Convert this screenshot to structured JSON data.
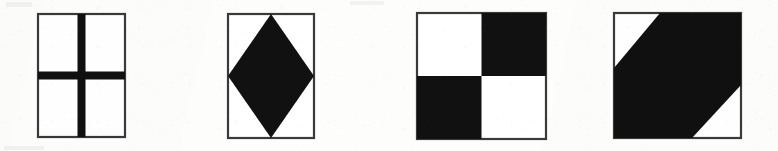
{
  "page": {
    "kind": "scanned-figure-strip",
    "background_color": "#fdfdfc",
    "ink_color": "#111111",
    "outline_color": "#3a3a3a",
    "width": 778,
    "height": 151,
    "caption": ""
  },
  "figures": [
    {
      "index": 1,
      "name": "cross-square",
      "label": "",
      "pattern": "cross",
      "description": "Square divided into four white quadrants by a thick black cross",
      "fill_color": "#111111",
      "background_color": "#ffffff",
      "outline_color": "#3a3a3a",
      "box": {
        "x": 38,
        "y": 14,
        "width": 87,
        "height": 123
      },
      "bar_thickness": 8,
      "symmetry": "4-fold"
    },
    {
      "index": 2,
      "name": "diamond-square",
      "label": "",
      "pattern": "diamond",
      "description": "Black diamond inscribed in a square, vertices touching edge midpoints",
      "fill_color": "#111111",
      "background_color": "#ffffff",
      "outline_color": "#3a3a3a",
      "box": {
        "x": 228,
        "y": 14,
        "width": 86,
        "height": 124
      },
      "symmetry": "4-fold"
    },
    {
      "index": 3,
      "name": "checkerboard-square",
      "label": "",
      "pattern": "checkerboard",
      "description": "Square split into four quadrants: top-left white, top-right black, bottom-left black, bottom-right white",
      "fill_color": "#111111",
      "background_color": "#ffffff",
      "outline_color": "#3a3a3a",
      "box": {
        "x": 417,
        "y": 13,
        "width": 129,
        "height": 126
      },
      "quadrants": [
        "white",
        "black",
        "black",
        "white"
      ],
      "symmetry": "2-fold"
    },
    {
      "index": 4,
      "name": "diagonal-band-square",
      "label": "",
      "pattern": "diagonal-band",
      "description": "Thick black diagonal band from lower-left to upper-right with white triangles at top-left and bottom-right",
      "fill_color": "#111111",
      "background_color": "#ffffff",
      "outline_color": "#3a3a3a",
      "box": {
        "x": 614,
        "y": 13,
        "width": 127,
        "height": 125
      },
      "symmetry": "2-fold"
    }
  ]
}
